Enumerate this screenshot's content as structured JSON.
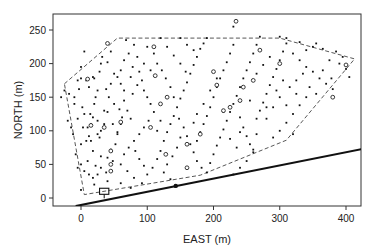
{
  "chart_data": {
    "type": "scatter",
    "title": "",
    "xlabel": "EAST  (m)",
    "ylabel": "NORTH  (m)",
    "xlim": [
      -40,
      430
    ],
    "ylim": [
      -12,
      273
    ],
    "xticks": [
      0,
      100,
      200,
      300,
      400
    ],
    "yticks": [
      0,
      50,
      100,
      150,
      200,
      250
    ],
    "grid": false,
    "legend": null,
    "boundary_polygon_dashed": [
      [
        -25,
        170
      ],
      [
        55,
        238
      ],
      [
        300,
        238
      ],
      [
        413,
        207
      ],
      [
        310,
        86
      ],
      [
        180,
        34
      ],
      [
        5,
        5
      ],
      [
        -25,
        170
      ]
    ],
    "thick_line": [
      [
        -8,
        -12
      ],
      [
        425,
        73
      ]
    ],
    "line_marker_point": [
      143,
      18
    ],
    "rectangle_marker": {
      "x": 35,
      "y": 10,
      "w": 14,
      "h": 9
    },
    "series": [
      {
        "name": "filled-points",
        "marker": "square-filled",
        "points": [
          [
            -30,
            150
          ],
          [
            -25,
            160
          ],
          [
            -20,
            115
          ],
          [
            -15,
            105
          ],
          [
            -10,
            140
          ],
          [
            -5,
            118
          ],
          [
            -12,
            95
          ],
          [
            -8,
            65
          ],
          [
            -5,
            45
          ],
          [
            0,
            50
          ],
          [
            -18,
            155
          ],
          [
            -10,
            150
          ],
          [
            -5,
            175
          ],
          [
            0,
            195
          ],
          [
            2,
            135
          ],
          [
            5,
            125
          ],
          [
            3,
            105
          ],
          [
            0,
            80
          ],
          [
            8,
            85
          ],
          [
            12,
            92
          ],
          [
            15,
            110
          ],
          [
            18,
            120
          ],
          [
            20,
            140
          ],
          [
            22,
            150
          ],
          [
            25,
            160
          ],
          [
            12,
            165
          ],
          [
            8,
            175
          ],
          [
            18,
            180
          ],
          [
            0,
            178
          ],
          [
            -3,
            162
          ],
          [
            20,
            178
          ],
          [
            28,
            188
          ],
          [
            30,
            200
          ],
          [
            40,
            202
          ],
          [
            32,
            210
          ],
          [
            45,
            218
          ],
          [
            5,
            218
          ],
          [
            10,
            105
          ],
          [
            14,
            125
          ],
          [
            25,
            115
          ],
          [
            30,
            100
          ],
          [
            35,
            110
          ],
          [
            28,
            90
          ],
          [
            15,
            85
          ],
          [
            5,
            40
          ],
          [
            12,
            35
          ],
          [
            18,
            30
          ],
          [
            10,
            55
          ],
          [
            22,
            48
          ],
          [
            25,
            35
          ],
          [
            30,
            45
          ],
          [
            38,
            38
          ],
          [
            40,
            60
          ],
          [
            48,
            55
          ],
          [
            45,
            72
          ],
          [
            52,
            80
          ],
          [
            55,
            95
          ],
          [
            60,
            110
          ],
          [
            62,
            120
          ],
          [
            58,
            132
          ],
          [
            50,
            140
          ],
          [
            42,
            150
          ],
          [
            38,
            162
          ],
          [
            45,
            170
          ],
          [
            55,
            180
          ],
          [
            60,
            190
          ],
          [
            65,
            205
          ],
          [
            72,
            215
          ],
          [
            80,
            228
          ],
          [
            68,
            235
          ],
          [
            78,
            195
          ],
          [
            88,
            188
          ],
          [
            92,
            175
          ],
          [
            95,
            160
          ],
          [
            100,
            150
          ],
          [
            105,
            140
          ],
          [
            110,
            128
          ],
          [
            102,
            115
          ],
          [
            95,
            105
          ],
          [
            88,
            95
          ],
          [
            80,
            85
          ],
          [
            72,
            75
          ],
          [
            65,
            65
          ],
          [
            60,
            50
          ],
          [
            70,
            40
          ],
          [
            80,
            30
          ],
          [
            92,
            22
          ],
          [
            100,
            35
          ],
          [
            108,
            45
          ],
          [
            115,
            58
          ],
          [
            120,
            70
          ],
          [
            125,
            85
          ],
          [
            130,
            98
          ],
          [
            135,
            110
          ],
          [
            140,
            122
          ],
          [
            145,
            135
          ],
          [
            150,
            148
          ],
          [
            155,
            160
          ],
          [
            160,
            172
          ],
          [
            165,
            185
          ],
          [
            170,
            198
          ],
          [
            175,
            210
          ],
          [
            180,
            222
          ],
          [
            185,
            230
          ],
          [
            190,
            238
          ],
          [
            120,
            238
          ],
          [
            130,
            225
          ],
          [
            140,
            212
          ],
          [
            150,
            200
          ],
          [
            158,
            188
          ],
          [
            100,
            225
          ],
          [
            110,
            215
          ],
          [
            115,
            200
          ],
          [
            122,
            190
          ],
          [
            128,
            178
          ],
          [
            135,
            165
          ],
          [
            140,
            150
          ],
          [
            148,
            118
          ],
          [
            155,
            105
          ],
          [
            160,
            92
          ],
          [
            165,
            80
          ],
          [
            170,
            68
          ],
          [
            175,
            55
          ],
          [
            182,
            45
          ],
          [
            190,
            38
          ],
          [
            195,
            52
          ],
          [
            200,
            65
          ],
          [
            205,
            78
          ],
          [
            210,
            90
          ],
          [
            215,
            102
          ],
          [
            220,
            115
          ],
          [
            225,
            128
          ],
          [
            230,
            140
          ],
          [
            235,
            152
          ],
          [
            240,
            165
          ],
          [
            245,
            178
          ],
          [
            250,
            190
          ],
          [
            255,
            202
          ],
          [
            260,
            215
          ],
          [
            265,
            228
          ],
          [
            270,
            240
          ],
          [
            200,
            150
          ],
          [
            205,
            165
          ],
          [
            210,
            178
          ],
          [
            215,
            190
          ],
          [
            220,
            202
          ],
          [
            225,
            215
          ],
          [
            230,
            228
          ],
          [
            195,
            135
          ],
          [
            190,
            122
          ],
          [
            185,
            110
          ],
          [
            180,
            98
          ],
          [
            175,
            85
          ],
          [
            245,
            105
          ],
          [
            250,
            92
          ],
          [
            255,
            80
          ],
          [
            260,
            68
          ],
          [
            265,
            118
          ],
          [
            270,
            130
          ],
          [
            275,
            142
          ],
          [
            280,
            155
          ],
          [
            285,
            168
          ],
          [
            290,
            180
          ],
          [
            295,
            192
          ],
          [
            300,
            205
          ],
          [
            305,
            218
          ],
          [
            310,
            230
          ],
          [
            320,
            215
          ],
          [
            330,
            205
          ],
          [
            340,
            195
          ],
          [
            350,
            188
          ],
          [
            360,
            178
          ],
          [
            370,
            170
          ],
          [
            380,
            162
          ],
          [
            390,
            200
          ],
          [
            395,
            210
          ],
          [
            400,
            192
          ],
          [
            405,
            180
          ],
          [
            340,
            150
          ],
          [
            330,
            138
          ],
          [
            320,
            125
          ],
          [
            310,
            112
          ],
          [
            300,
            100
          ],
          [
            290,
            90
          ],
          [
            280,
            135
          ],
          [
            295,
            160
          ],
          [
            305,
            175
          ],
          [
            315,
            165
          ],
          [
            325,
            175
          ],
          [
            335,
            185
          ],
          [
            345,
            165
          ],
          [
            355,
            155
          ],
          [
            365,
            190
          ],
          [
            375,
            205
          ],
          [
            385,
            218
          ],
          [
            320,
            95
          ],
          [
            240,
            45
          ],
          [
            250,
            55
          ],
          [
            260,
            72
          ],
          [
            230,
            35
          ],
          [
            150,
            90
          ],
          [
            145,
            75
          ],
          [
            138,
            62
          ],
          [
            130,
            50
          ],
          [
            125,
            38
          ],
          [
            135,
            28
          ],
          [
            82,
            70
          ],
          [
            88,
            58
          ],
          [
            95,
            48
          ],
          [
            75,
            118
          ],
          [
            70,
            130
          ],
          [
            65,
            145
          ],
          [
            78,
            155
          ],
          [
            85,
            168
          ],
          [
            60,
            170
          ],
          [
            50,
            185
          ],
          [
            115,
            100
          ],
          [
            120,
            115
          ],
          [
            170,
            112
          ],
          [
            175,
            125
          ],
          [
            185,
            140
          ],
          [
            195,
            160
          ],
          [
            205,
            178
          ],
          [
            240,
            120
          ],
          [
            215,
            128
          ],
          [
            225,
            88
          ],
          [
            235,
            75
          ],
          [
            240,
            98
          ],
          [
            255,
            145
          ],
          [
            265,
            95
          ],
          [
            280,
            118
          ],
          [
            290,
            135
          ],
          [
            300,
            150
          ],
          [
            310,
            138
          ],
          [
            325,
            155
          ],
          [
            340,
            220
          ],
          [
            355,
            230
          ],
          [
            365,
            222
          ],
          [
            378,
            178
          ],
          [
            230,
            255
          ],
          [
            300,
            240
          ],
          [
            310,
            238
          ],
          [
            330,
            232
          ],
          [
            350,
            225
          ],
          [
            285,
            210
          ],
          [
            275,
            198
          ],
          [
            265,
            185
          ],
          [
            150,
            238
          ],
          [
            160,
            228
          ],
          [
            170,
            220
          ],
          [
            105,
            190
          ],
          [
            95,
            200
          ],
          [
            85,
            210
          ],
          [
            75,
            180
          ],
          [
            65,
            160
          ],
          [
            40,
            128
          ],
          [
            48,
            110
          ],
          [
            55,
            98
          ],
          [
            35,
            130
          ],
          [
            25,
            95
          ],
          [
            18,
            70
          ],
          [
            30,
            62
          ],
          [
            20,
            20
          ],
          [
            40,
            25
          ],
          [
            60,
            22
          ],
          [
            75,
            15
          ],
          [
            0,
            12
          ]
        ]
      },
      {
        "name": "open-circles",
        "marker": "circle-open",
        "points": [
          [
            40,
            230
          ],
          [
            10,
            177
          ],
          [
            60,
            113
          ],
          [
            35,
            105
          ],
          [
            15,
            108
          ],
          [
            45,
            70
          ],
          [
            45,
            50
          ],
          [
            45,
            40
          ],
          [
            105,
            105
          ],
          [
            112,
            182
          ],
          [
            110,
            225
          ],
          [
            128,
            65
          ],
          [
            160,
            80
          ],
          [
            180,
            95
          ],
          [
            200,
            188
          ],
          [
            205,
            168
          ],
          [
            215,
            130
          ],
          [
            225,
            135
          ],
          [
            160,
            45
          ],
          [
            240,
            145
          ],
          [
            245,
            165
          ],
          [
            260,
            175
          ],
          [
            234,
            263
          ],
          [
            300,
            200
          ],
          [
            400,
            198
          ],
          [
            380,
            150
          ],
          [
            270,
            220
          ],
          [
            130,
            150
          ],
          [
            120,
            140
          ]
        ]
      }
    ]
  }
}
